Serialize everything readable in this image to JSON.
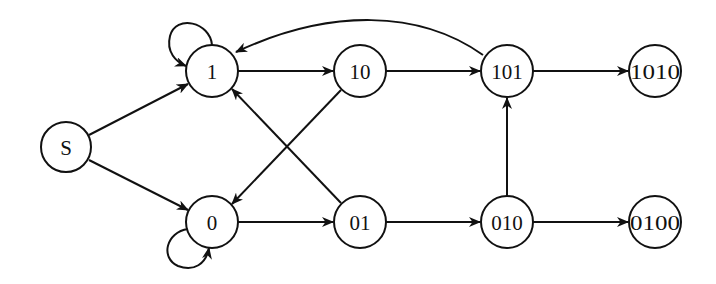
{
  "diagram": {
    "type": "state-transition-graph",
    "colors": {
      "stroke": "#111111",
      "background": "#ffffff",
      "node_fill": "#ffffff"
    },
    "nodes": [
      {
        "id": "S",
        "label": "S",
        "x": 66,
        "y": 147,
        "r": 25
      },
      {
        "id": "1",
        "label": "1",
        "x": 212,
        "y": 71,
        "r": 26
      },
      {
        "id": "0",
        "label": "0",
        "x": 212,
        "y": 222,
        "r": 26
      },
      {
        "id": "10",
        "label": "10",
        "x": 360,
        "y": 71,
        "r": 26
      },
      {
        "id": "01",
        "label": "01",
        "x": 360,
        "y": 222,
        "r": 26
      },
      {
        "id": "101",
        "label": "101",
        "x": 507,
        "y": 71,
        "r": 26
      },
      {
        "id": "010",
        "label": "010",
        "x": 507,
        "y": 222,
        "r": 26
      },
      {
        "id": "1010",
        "label": "1010",
        "x": 655,
        "y": 71,
        "r": 26
      },
      {
        "id": "0100",
        "label": "0100",
        "x": 655,
        "y": 222,
        "r": 26
      }
    ],
    "edges": [
      {
        "from": "S",
        "to": "1"
      },
      {
        "from": "S",
        "to": "0"
      },
      {
        "from": "1",
        "to": "1",
        "kind": "self-loop"
      },
      {
        "from": "0",
        "to": "0",
        "kind": "self-loop"
      },
      {
        "from": "1",
        "to": "10"
      },
      {
        "from": "10",
        "to": "101"
      },
      {
        "from": "10",
        "to": "0"
      },
      {
        "from": "0",
        "to": "01"
      },
      {
        "from": "01",
        "to": "1"
      },
      {
        "from": "01",
        "to": "010"
      },
      {
        "from": "010",
        "to": "101"
      },
      {
        "from": "010",
        "to": "0100"
      },
      {
        "from": "101",
        "to": "1010"
      },
      {
        "from": "101",
        "to": "1",
        "kind": "curved"
      }
    ]
  }
}
